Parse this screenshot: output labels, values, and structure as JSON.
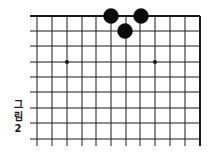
{
  "caption": {
    "line1": "그",
    "line2": "림",
    "line3": "2"
  },
  "board": {
    "colors": {
      "line": "#1a1a1a",
      "stone_black": "#0a0a0a",
      "background": "#ffffff"
    },
    "vertical_lines_x": [
      37,
      52,
      67,
      82,
      96,
      111,
      126,
      140,
      155,
      170,
      185,
      200
    ],
    "horizontal_lines_y": [
      16,
      31,
      46,
      62,
      77,
      92,
      108,
      123,
      139
    ],
    "edges": {
      "top": true,
      "right": true,
      "left": false,
      "bottom": false
    },
    "star_points": [
      {
        "x": 67,
        "y": 62
      },
      {
        "x": 155,
        "y": 62
      }
    ],
    "stones": [
      {
        "color": "black",
        "x": 111,
        "y": 16
      },
      {
        "color": "black",
        "x": 141,
        "y": 16
      },
      {
        "color": "black",
        "x": 125,
        "y": 31
      }
    ]
  }
}
